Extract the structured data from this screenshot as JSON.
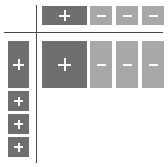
{
  "panel": {
    "background_color": "#ffffff",
    "divider_color": "#4a4a4a",
    "colors": {
      "button_dark": "#6e6e6e",
      "button_light": "#a8a8a8",
      "glyph": "#ffffff"
    }
  },
  "glyphs": {
    "plus": "+",
    "minus": "−"
  },
  "column_header_strip": {
    "name": "column-header-strip",
    "buttons": [
      {
        "label": "+",
        "icon": "plus-icon",
        "state": "expanded",
        "tone": "dark"
      },
      {
        "label": "−",
        "icon": "minus-icon",
        "state": "collapsed",
        "tone": "light"
      },
      {
        "label": "−",
        "icon": "minus-icon",
        "state": "collapsed",
        "tone": "light"
      },
      {
        "label": "−",
        "icon": "minus-icon",
        "state": "collapsed",
        "tone": "light"
      }
    ]
  },
  "row_header_strip": {
    "name": "row-header-strip",
    "buttons": [
      {
        "label": "+",
        "icon": "plus-icon",
        "state": "expanded",
        "tone": "dark"
      },
      {
        "label": "+",
        "icon": "plus-icon",
        "state": "expanded",
        "tone": "dark"
      },
      {
        "label": "+",
        "icon": "plus-icon",
        "state": "expanded",
        "tone": "dark"
      },
      {
        "label": "+",
        "icon": "plus-icon",
        "state": "expanded",
        "tone": "dark"
      }
    ]
  },
  "content_grid": {
    "name": "content-grid",
    "buttons": [
      {
        "label": "+",
        "icon": "plus-icon",
        "state": "expanded",
        "tone": "dark"
      },
      {
        "label": "−",
        "icon": "minus-icon",
        "state": "collapsed",
        "tone": "light"
      },
      {
        "label": "−",
        "icon": "minus-icon",
        "state": "collapsed",
        "tone": "light"
      },
      {
        "label": "−",
        "icon": "minus-icon",
        "state": "collapsed",
        "tone": "light"
      }
    ]
  }
}
